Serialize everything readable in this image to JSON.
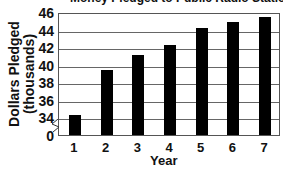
{
  "chart_data": {
    "type": "bar",
    "title": "Money Pledged to Public Radio Station",
    "xlabel": "Year",
    "ylabel": "Dollars Pledged (thousands)",
    "ylabel_lines": [
      "Dollars Pledged",
      "(thousands)"
    ],
    "categories": [
      "1",
      "2",
      "3",
      "4",
      "5",
      "6",
      "7"
    ],
    "values": [
      34.4,
      39.5,
      41.2,
      42.3,
      44.3,
      45.0,
      45.5
    ],
    "yticks": [
      "46",
      "44",
      "42",
      "40",
      "38",
      "36",
      "34",
      "0"
    ],
    "ylim": [
      34,
      46
    ],
    "axis_break": true,
    "grid": true,
    "legend": null
  }
}
